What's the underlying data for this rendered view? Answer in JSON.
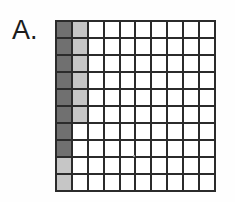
{
  "figure": {
    "label": "A.",
    "label_name": "panel-label-a"
  },
  "colors": {
    "grid_line": "#2b2b2b",
    "cell_empty": "#ffffff",
    "cell_dark": "#707070",
    "cell_light": "#c6c6c6",
    "label_text": "#1c1c1c",
    "background": "#fefefe"
  },
  "chart_data": {
    "type": "heatmap",
    "title": "A.",
    "xlabel": "",
    "ylabel": "",
    "columns": 10,
    "rows": 10,
    "legend": [
      {
        "key": "dark",
        "label": "dark gray",
        "color": "#707070"
      },
      {
        "key": "light",
        "label": "light gray",
        "color": "#c6c6c6"
      },
      {
        "key": "white",
        "label": "unshaded",
        "color": "#ffffff"
      }
    ],
    "counts": {
      "dark_cells": 8,
      "light_cells": 8,
      "white_cells": 84,
      "total_cells": 100
    },
    "grid": [
      [
        "dark",
        "light",
        "white",
        "white",
        "white",
        "white",
        "white",
        "white",
        "white",
        "white"
      ],
      [
        "dark",
        "light",
        "white",
        "white",
        "white",
        "white",
        "white",
        "white",
        "white",
        "white"
      ],
      [
        "dark",
        "light",
        "white",
        "white",
        "white",
        "white",
        "white",
        "white",
        "white",
        "white"
      ],
      [
        "dark",
        "light",
        "white",
        "white",
        "white",
        "white",
        "white",
        "white",
        "white",
        "white"
      ],
      [
        "dark",
        "light",
        "white",
        "white",
        "white",
        "white",
        "white",
        "white",
        "white",
        "white"
      ],
      [
        "dark",
        "light",
        "white",
        "white",
        "white",
        "white",
        "white",
        "white",
        "white",
        "white"
      ],
      [
        "dark",
        "white",
        "white",
        "white",
        "white",
        "white",
        "white",
        "white",
        "white",
        "white"
      ],
      [
        "dark",
        "white",
        "white",
        "white",
        "white",
        "white",
        "white",
        "white",
        "white",
        "white"
      ],
      [
        "light",
        "white",
        "white",
        "white",
        "white",
        "white",
        "white",
        "white",
        "white",
        "white"
      ],
      [
        "light",
        "white",
        "white",
        "white",
        "white",
        "white",
        "white",
        "white",
        "white",
        "white"
      ]
    ]
  }
}
